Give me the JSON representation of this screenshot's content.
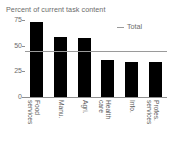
{
  "chart_data": {
    "type": "bar",
    "title": "Percent of current task content",
    "subtitle": "",
    "xlabel": "",
    "ylabel": "",
    "ylim": [
      0,
      75
    ],
    "yticks": [
      0,
      25,
      50,
      75
    ],
    "ytick_labels": [
      "0",
      "25",
      "50",
      "75"
    ],
    "grid": false,
    "legend_position": "top-right",
    "categories": [
      "Food\nservices",
      "Manu.",
      "Agri.",
      "Health\ncare",
      "Info.",
      "Profes.\nservices"
    ],
    "values": [
      73,
      58,
      57,
      36,
      34,
      34
    ],
    "series": [
      {
        "name": "Percent of current task content",
        "type": "bar",
        "color": "#000000",
        "values": [
          73,
          58,
          57,
          36,
          34,
          34
        ]
      },
      {
        "name": "Total",
        "type": "hline",
        "color": "#9a9a9a",
        "value": 45
      }
    ],
    "legend": [
      {
        "label": "Total",
        "marker": "line",
        "color": "#9a9a9a"
      }
    ],
    "annotations": []
  },
  "colors": {
    "bar": "#000000",
    "total_line": "#9a9a9a",
    "axis": "#8f8f8f",
    "text": "#6b6b6b",
    "background": "#ffffff"
  }
}
